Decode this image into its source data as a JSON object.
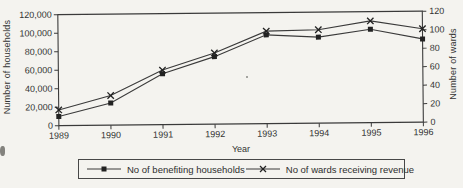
{
  "chart_data": {
    "type": "line",
    "title": "",
    "x": [
      1989,
      1990,
      1991,
      1992,
      1993,
      1994,
      1995,
      1996
    ],
    "x_axis": {
      "label": "Year",
      "ticks": [
        "1989",
        "1990",
        "1991",
        "1992",
        "1993",
        "1994",
        "1995",
        "1996"
      ]
    },
    "left_axis": {
      "label": "Number of households",
      "min": 0,
      "max": 120000,
      "tick_step": 20000,
      "ticks": [
        "0",
        "20,000",
        "40,000",
        "60,000",
        "80,000",
        "100,000",
        "120,000"
      ]
    },
    "right_axis": {
      "label": "Number of wards",
      "min": 0,
      "max": 120,
      "tick_step": 20,
      "ticks": [
        "0",
        "20",
        "40",
        "60",
        "80",
        "100",
        "120"
      ]
    },
    "series": [
      {
        "name": "No of benefiting households",
        "axis": "left",
        "marker": "square",
        "values": [
          10000,
          24000,
          55000,
          73000,
          96000,
          93000,
          101000,
          90000
        ]
      },
      {
        "name": "No of wards receiving revenue",
        "axis": "right",
        "marker": "x",
        "values": [
          17,
          32,
          59,
          77,
          100,
          101,
          110,
          101
        ]
      }
    ],
    "legend": {
      "position": "bottom"
    },
    "grid": "off",
    "colors": {
      "line": "#3a3a3a",
      "ink": "#333333",
      "marker": "#222222",
      "background": "#f4f3ef"
    }
  }
}
